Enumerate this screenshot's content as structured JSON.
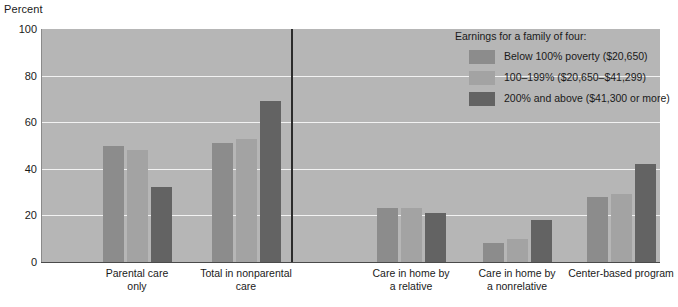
{
  "chart_data": {
    "type": "bar",
    "title": "",
    "xlabel": "",
    "ylabel": "Percent",
    "ylim": [
      0,
      100
    ],
    "yticks": [
      0,
      20,
      40,
      60,
      80,
      100
    ],
    "grid": true,
    "legend_position": "top-right",
    "legend_title": "Earnings for a family of four:",
    "categories": [
      "Parental care\nonly",
      "Total in nonparental\ncare",
      "Care in home by\na relative",
      "Care in home by\na nonrelative",
      "Center-based program"
    ],
    "series": [
      {
        "name": "Below 100% poverty ($20,650)",
        "color": "#8c8c8c",
        "values": [
          50,
          51,
          23,
          8,
          28
        ]
      },
      {
        "name": "100–199% ($20,650–$41,299)",
        "color": "#a3a3a3",
        "values": [
          48,
          53,
          23,
          10,
          29
        ]
      },
      {
        "name": "200% and above ($41,300 or more)",
        "color": "#636363",
        "values": [
          32,
          69,
          21,
          18,
          42
        ]
      }
    ],
    "divider_after_category_index": 1,
    "plot_background": "#b6b6b6",
    "gridline_color": "#f2f2f2"
  }
}
